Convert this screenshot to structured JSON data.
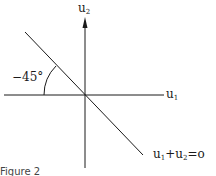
{
  "figure": {
    "caption": "Figure 2",
    "axes": {
      "x_label": "u",
      "x_sub": "1",
      "y_label": "u",
      "y_sub": "2"
    },
    "angle_label": "−45°",
    "line_label": {
      "a": "u",
      "a_sub": "1",
      "op": "+",
      "b": "u",
      "b_sub": "2",
      "eq": "=o"
    },
    "colors": {
      "ink": "#1a1a1a",
      "background": "#ffffff"
    }
  }
}
